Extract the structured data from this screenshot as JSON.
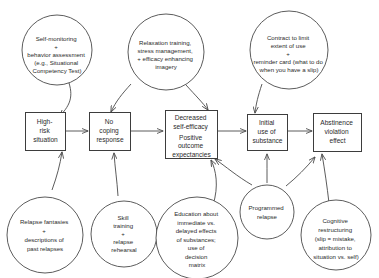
{
  "diagram": {
    "type": "flow-diagram",
    "stroke_color": "#4a4a4a",
    "text_color": "#2b2b2b",
    "background_color": "#ffffff",
    "boxes": [
      {
        "id": "high-risk-situation",
        "lines": [
          "High-",
          "risk",
          "situation"
        ]
      },
      {
        "id": "no-coping-response",
        "lines": [
          "No",
          "coping",
          "response"
        ]
      },
      {
        "id": "decreased-self-efficacy",
        "lines": [
          "Decreased",
          "self-efficacy",
          "",
          "Positive",
          "outcome",
          "expectancies"
        ]
      },
      {
        "id": "initial-use-of-substance",
        "lines": [
          "Initial",
          "use of",
          "substance"
        ]
      },
      {
        "id": "abstinence-violation-effect",
        "lines": [
          "Abstinence",
          "violation",
          "effect"
        ]
      }
    ],
    "circles": [
      {
        "id": "self-monitoring",
        "lines": [
          "Self-monitoring",
          "+",
          "behavior assessment",
          "(e.g., Situational",
          "Competency Test)"
        ]
      },
      {
        "id": "relaxation-training",
        "lines": [
          "Relaxation training,",
          "stress management,",
          "+ efficacy enhancing",
          "imagery"
        ]
      },
      {
        "id": "contract-to-limit-use",
        "lines": [
          "Contract to limit",
          "extent of use",
          "+",
          "reminder card (what to do",
          "when you have a slip)"
        ]
      },
      {
        "id": "relapse-fantasies",
        "lines": [
          "Relapse fantasies",
          "+",
          "descriptions of",
          "past relapses"
        ]
      },
      {
        "id": "skill-training",
        "lines": [
          "Skill",
          "training",
          "+",
          "relapse",
          "rehearsal"
        ]
      },
      {
        "id": "education-about-effects",
        "lines": [
          "Education about",
          "immediate vs.",
          "delayed effects",
          "of substances;",
          "use of",
          "decision",
          "matrix"
        ]
      },
      {
        "id": "programmed-relapse",
        "lines": [
          "Programmed",
          "relapse"
        ]
      },
      {
        "id": "cognitive-restructuring",
        "lines": [
          "Cognitive",
          "restructuring",
          "(slip = mistake,",
          "attribution to",
          "situation vs. self)"
        ]
      }
    ]
  }
}
